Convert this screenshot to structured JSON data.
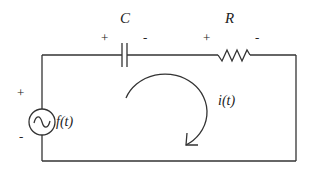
{
  "diagram": {
    "type": "series RC circuit",
    "components": {
      "capacitor": {
        "label": "C",
        "plus": "+",
        "minus": "-"
      },
      "resistor": {
        "label": "R",
        "plus": "+",
        "minus": "-"
      },
      "source": {
        "label": "f(t)",
        "plus": "+",
        "minus": "-",
        "symbol": "ac-source-icon"
      }
    },
    "current": {
      "label": "i(t)",
      "direction": "clockwise"
    }
  },
  "colors": {
    "line": "#333333",
    "text": "#222222",
    "background": "#ffffff"
  }
}
